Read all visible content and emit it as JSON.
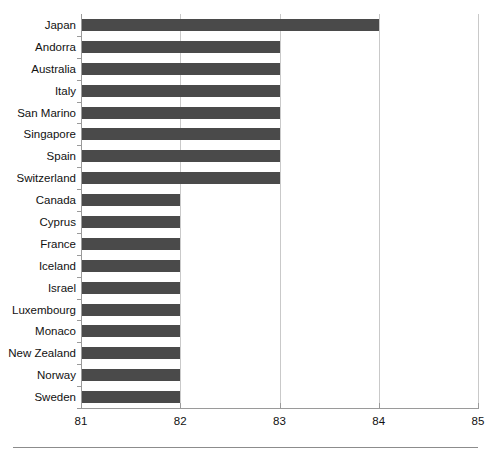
{
  "chart_data": {
    "type": "bar",
    "orientation": "horizontal",
    "title": "",
    "subtitle": "",
    "xlabel": "",
    "ylabel": "",
    "xlim": [
      81,
      85
    ],
    "xticks": [
      81,
      82,
      83,
      84,
      85
    ],
    "xtick_labels": [
      "81",
      "82",
      "83",
      "84",
      "85"
    ],
    "grid": "vertical",
    "legend": "none",
    "bar_color": "#4a4a4a",
    "axis_color": "#9a9a9a",
    "grid_color": "#c9c9c9",
    "background": "#ffffff",
    "categories": [
      "Japan",
      "Andorra",
      "Australia",
      "Italy",
      "San Marino",
      "Singapore",
      "Spain",
      "Switzerland",
      "Canada",
      "Cyprus",
      "France",
      "Iceland",
      "Israel",
      "Luxembourg",
      "Monaco",
      "New Zealand",
      "Norway",
      "Sweden"
    ],
    "values": [
      84,
      83,
      83,
      83,
      83,
      83,
      83,
      83,
      82,
      82,
      82,
      82,
      82,
      82,
      82,
      82,
      82,
      82
    ]
  }
}
